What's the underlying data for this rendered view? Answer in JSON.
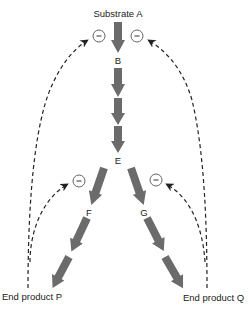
{
  "diagram": {
    "nodes": {
      "A": "Substrate A",
      "B": "B",
      "E": "E",
      "F": "F",
      "G": "G",
      "P": "End product P",
      "Q": "End product Q"
    },
    "inhibition_symbol": "−",
    "colors": {
      "pathway_arrow": "#6b6b6b",
      "feedback_line": "#222222",
      "inhibition_circle": "#555555",
      "label_text": "#222222"
    },
    "edges": [
      {
        "from": "Substrate A",
        "to": "B",
        "type": "reaction"
      },
      {
        "from": "B",
        "to": "C",
        "type": "reaction"
      },
      {
        "from": "C",
        "to": "D",
        "type": "reaction"
      },
      {
        "from": "D",
        "to": "E",
        "type": "reaction"
      },
      {
        "from": "E",
        "to": "F",
        "type": "reaction"
      },
      {
        "from": "F",
        "to": "X",
        "type": "reaction"
      },
      {
        "from": "X",
        "to": "End product P",
        "type": "reaction"
      },
      {
        "from": "E",
        "to": "G",
        "type": "reaction"
      },
      {
        "from": "G",
        "to": "Y",
        "type": "reaction"
      },
      {
        "from": "Y",
        "to": "End product Q",
        "type": "reaction"
      },
      {
        "from": "End product P",
        "to": "A→B",
        "type": "inhibition"
      },
      {
        "from": "End product Q",
        "to": "A→B",
        "type": "inhibition"
      },
      {
        "from": "End product P",
        "to": "E→F",
        "type": "inhibition"
      },
      {
        "from": "End product Q",
        "to": "E→G",
        "type": "inhibition"
      }
    ]
  }
}
